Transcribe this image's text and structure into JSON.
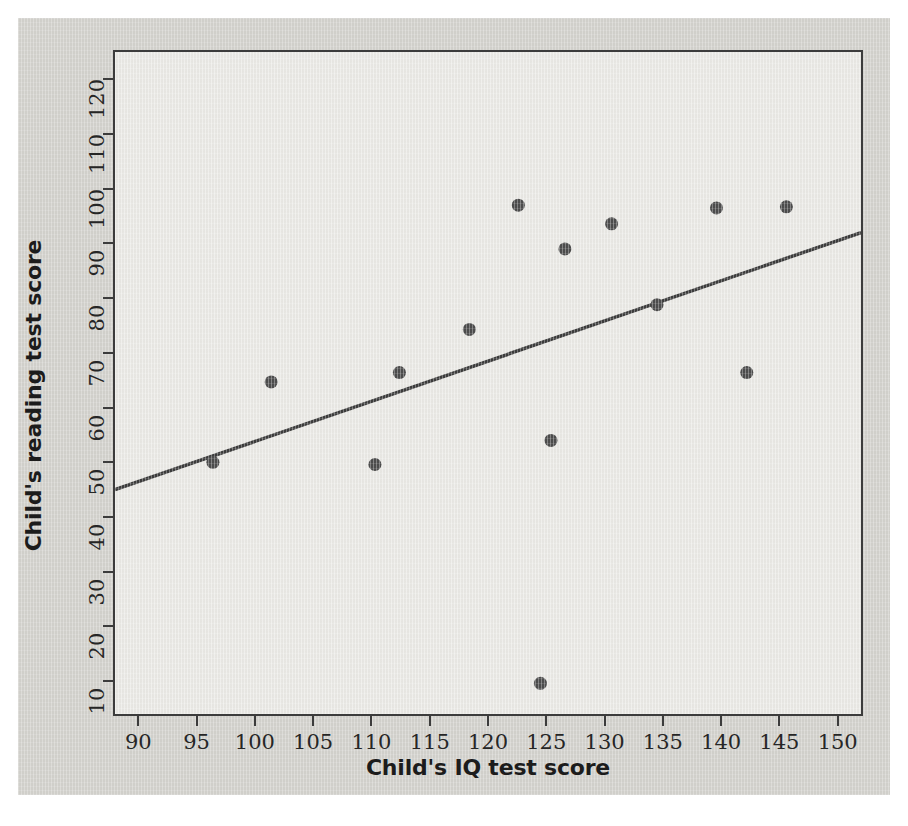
{
  "chart_data": {
    "type": "scatter",
    "title": "",
    "xlabel": "Child's IQ test score",
    "ylabel": "Child's reading test score",
    "xlim": [
      88,
      152
    ],
    "ylim": [
      4,
      125
    ],
    "xticks": [
      90,
      95,
      100,
      105,
      110,
      115,
      120,
      125,
      130,
      135,
      140,
      145,
      150
    ],
    "yticks": [
      10,
      20,
      30,
      40,
      50,
      60,
      70,
      80,
      90,
      100,
      110,
      120
    ],
    "grid": false,
    "legend": null,
    "point_color": "#4d4d4d",
    "line_color": "#3c3c3c",
    "panel_bg": "#ebeae6",
    "figure_bg": "#d4d3ce",
    "points": [
      {
        "x": 96.4,
        "y": 50.0
      },
      {
        "x": 101.4,
        "y": 64.7
      },
      {
        "x": 110.3,
        "y": 49.6
      },
      {
        "x": 112.4,
        "y": 66.4
      },
      {
        "x": 118.4,
        "y": 74.3
      },
      {
        "x": 122.6,
        "y": 97.0
      },
      {
        "x": 124.5,
        "y": 9.6
      },
      {
        "x": 125.4,
        "y": 54.0
      },
      {
        "x": 126.6,
        "y": 89.0
      },
      {
        "x": 130.6,
        "y": 93.6
      },
      {
        "x": 134.5,
        "y": 78.8
      },
      {
        "x": 139.6,
        "y": 96.5
      },
      {
        "x": 142.2,
        "y": 66.4
      },
      {
        "x": 145.6,
        "y": 96.7
      }
    ],
    "fit_line": {
      "name": "regression line",
      "x0": 88,
      "y0": 45.0,
      "x1": 152,
      "y1": 92.0
    }
  }
}
